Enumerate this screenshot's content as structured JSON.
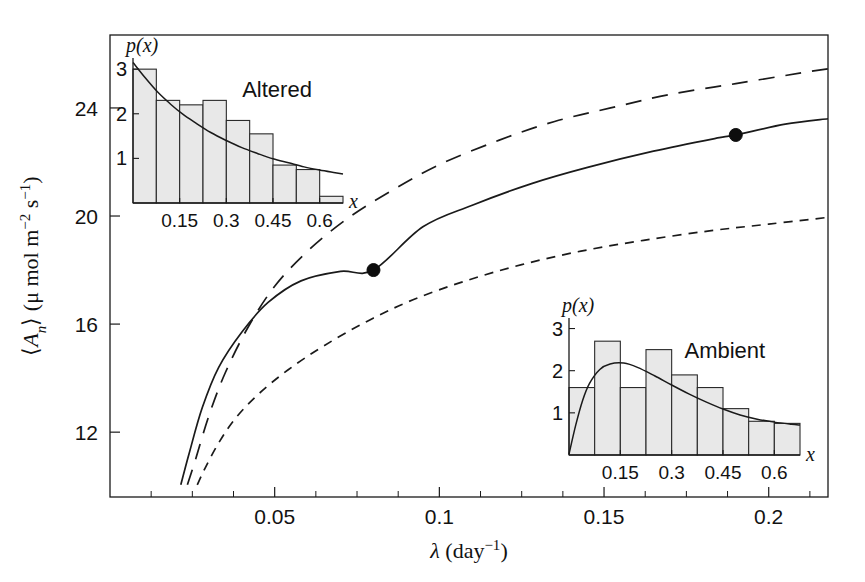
{
  "figure": {
    "width": 865,
    "height": 582,
    "background": "#ffffff",
    "ink_color": "#1a1a1a",
    "bar_fill": "#e8e8e8"
  },
  "chart_data": {
    "type": "line",
    "title": "",
    "xlabel": "λ (day⁻¹)",
    "ylabel": "⟨Aₙ⟩ (μ mol m⁻² s⁻¹)",
    "xlabel_parts": {
      "symbol": "λ",
      "unit_open": " (day",
      "unit_exp": "−1",
      "unit_close": ")"
    },
    "ylabel_parts": {
      "bracket_open": "⟨",
      "symbol": "A",
      "subscript": "n",
      "bracket_close": "⟩",
      "unit_open": " (μ mol m",
      "unit_exp1": "−2",
      "unit_mid": " s",
      "unit_exp2": "−1",
      "unit_close": ")"
    },
    "xlim": [
      0.0,
      0.218
    ],
    "ylim": [
      9.6,
      26.7
    ],
    "xticks": [
      0.05,
      0.1,
      0.15,
      0.2
    ],
    "xticklabels": [
      "0.05",
      "0.1",
      "0.15",
      "0.2"
    ],
    "xticks_minor": [
      0.0125,
      0.025,
      0.0375,
      0.0625,
      0.075,
      0.0875,
      0.1125,
      0.125,
      0.1375,
      0.1625,
      0.175,
      0.1875,
      0.2125
    ],
    "yticks": [
      12,
      16,
      20,
      24
    ],
    "yticklabels": [
      "12",
      "16",
      "20",
      "24"
    ],
    "grid": false,
    "legend": "none",
    "frame": "box",
    "series": [
      {
        "name": "upper-long-dashed",
        "style": "long-dashed",
        "x": [
          0.0235,
          0.026,
          0.03,
          0.035,
          0.042,
          0.05,
          0.06,
          0.072,
          0.085,
          0.1,
          0.118,
          0.135,
          0.152,
          0.17,
          0.19,
          0.21,
          0.218
        ],
        "y": [
          10.05,
          11.0,
          12.6,
          14.2,
          15.9,
          17.4,
          18.7,
          19.9,
          20.9,
          21.9,
          22.8,
          23.5,
          24.0,
          24.5,
          24.9,
          25.3,
          25.45
        ]
      },
      {
        "name": "middle-solid",
        "style": "solid",
        "x": [
          0.0215,
          0.024,
          0.028,
          0.033,
          0.04,
          0.048,
          0.058,
          0.07,
          0.08,
          0.095,
          0.11,
          0.128,
          0.145,
          0.165,
          0.185,
          0.19,
          0.205,
          0.218
        ],
        "y": [
          10.05,
          11.2,
          12.9,
          14.4,
          15.7,
          16.8,
          17.6,
          17.95,
          18.0,
          19.6,
          20.4,
          21.2,
          21.8,
          22.4,
          22.9,
          23.0,
          23.4,
          23.6
        ]
      },
      {
        "name": "lower-short-dashed",
        "style": "short-dashed",
        "x": [
          0.0265,
          0.029,
          0.033,
          0.038,
          0.045,
          0.054,
          0.065,
          0.078,
          0.092,
          0.108,
          0.125,
          0.143,
          0.162,
          0.182,
          0.2,
          0.218
        ],
        "y": [
          10.05,
          10.7,
          11.6,
          12.5,
          13.4,
          14.3,
          15.2,
          16.1,
          16.9,
          17.6,
          18.2,
          18.7,
          19.1,
          19.45,
          19.7,
          19.95
        ]
      }
    ],
    "markers": [
      {
        "name": "ambient-point",
        "x": 0.08,
        "y": 18.0,
        "shape": "filled-circle",
        "size": 13
      },
      {
        "name": "altered-point",
        "x": 0.19,
        "y": 23.0,
        "shape": "filled-circle",
        "size": 13
      }
    ],
    "insets": [
      {
        "id": "altered",
        "title": "Altered",
        "title_x": 0.52,
        "ylabel": "p(x)",
        "xlabel": "x",
        "type": "bar",
        "xticks": [
          0.15,
          0.3,
          0.45,
          0.6
        ],
        "xticklabels": [
          "0.15",
          "0.3",
          "0.45",
          "0.6"
        ],
        "yticks": [
          1,
          2,
          3
        ],
        "yticklabels": [
          "1",
          "2",
          "3"
        ],
        "xlim": [
          0.0,
          0.675
        ],
        "ylim": [
          0.0,
          3.25
        ],
        "bin_edges": [
          0.0,
          0.075,
          0.15,
          0.225,
          0.3,
          0.375,
          0.45,
          0.525,
          0.6,
          0.675
        ],
        "values": [
          3.0,
          2.3,
          2.2,
          2.3,
          1.85,
          1.55,
          0.85,
          0.75,
          0.15
        ],
        "fit_curve": {
          "name": "exponential-fit",
          "x": [
            0.0,
            0.04,
            0.08,
            0.12,
            0.16,
            0.2,
            0.25,
            0.3,
            0.35,
            0.4,
            0.45,
            0.5,
            0.55,
            0.6,
            0.65,
            0.675
          ],
          "y": [
            3.15,
            2.8,
            2.48,
            2.22,
            1.99,
            1.8,
            1.58,
            1.4,
            1.24,
            1.11,
            0.99,
            0.9,
            0.81,
            0.74,
            0.68,
            0.65
          ]
        }
      },
      {
        "id": "ambient",
        "title": "Ambient",
        "title_x": 0.5,
        "ylabel": "p(x)",
        "xlabel": "x",
        "type": "bar",
        "xticks": [
          0.15,
          0.3,
          0.45,
          0.6
        ],
        "xticklabels": [
          "0.15",
          "0.3",
          "0.45",
          "0.6"
        ],
        "yticks": [
          1,
          2,
          3
        ],
        "yticklabels": [
          "1",
          "2",
          "3"
        ],
        "xlim": [
          0.0,
          0.675
        ],
        "ylim": [
          0.0,
          3.25
        ],
        "bin_edges": [
          0.0,
          0.075,
          0.15,
          0.225,
          0.3,
          0.375,
          0.45,
          0.525,
          0.6,
          0.675
        ],
        "values": [
          1.6,
          2.7,
          1.6,
          2.5,
          1.9,
          1.6,
          1.1,
          0.8,
          0.75
        ],
        "fit_curve": {
          "name": "gamma-fit",
          "x": [
            0.0,
            0.02,
            0.04,
            0.06,
            0.09,
            0.12,
            0.16,
            0.2,
            0.25,
            0.3,
            0.35,
            0.4,
            0.45,
            0.5,
            0.55,
            0.6,
            0.65,
            0.675
          ],
          "y": [
            0.02,
            0.72,
            1.3,
            1.7,
            2.03,
            2.16,
            2.18,
            2.08,
            1.88,
            1.66,
            1.45,
            1.26,
            1.09,
            0.95,
            0.85,
            0.78,
            0.73,
            0.71
          ]
        }
      }
    ]
  }
}
